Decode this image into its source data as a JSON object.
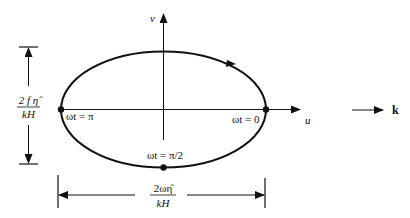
{
  "diagram": {
    "type": "hodograph-ellipse",
    "axes": {
      "horizontal_label": "u",
      "vertical_label": "v"
    },
    "points": [
      {
        "label": "ωt = 0",
        "position": "right"
      },
      {
        "label": "ωt = π/2",
        "position": "bottom"
      },
      {
        "label": "ωt = π",
        "position": "left"
      }
    ],
    "rotation_direction": "clockwise",
    "wave_vector_label": "k",
    "dimensions": {
      "vertical": {
        "numerator": "2 f η̂",
        "denominator": "kH"
      },
      "horizontal": {
        "numerator": "2ωη̂",
        "denominator": "kH"
      }
    }
  }
}
